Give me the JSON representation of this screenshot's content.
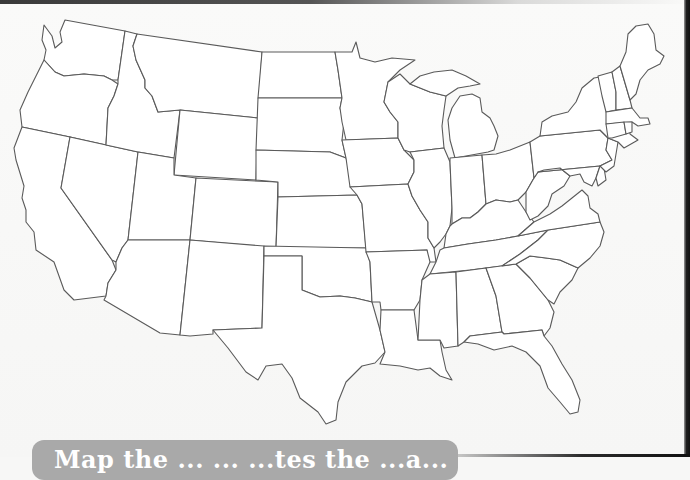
{
  "page": {
    "type": "printed worksheet photo",
    "background_color": "#f7f7f6",
    "outline_color": "#5a5a5a",
    "fill_color": "#ffffff"
  },
  "map": {
    "subject": "Blank outline map of the contiguous United States",
    "labels_visible": false,
    "regions": [
      "washington",
      "oregon",
      "california",
      "idaho",
      "nevada",
      "montana",
      "wyoming",
      "utah",
      "arizona",
      "colorado",
      "new-mexico",
      "north-dakota",
      "south-dakota",
      "nebraska",
      "kansas",
      "oklahoma",
      "texas",
      "minnesota",
      "iowa",
      "missouri",
      "arkansas",
      "louisiana",
      "wisconsin",
      "illinois",
      "michigan",
      "indiana",
      "ohio",
      "kentucky",
      "tennessee",
      "mississippi",
      "alabama",
      "georgia",
      "florida",
      "south-carolina",
      "north-carolina",
      "virginia",
      "west-virginia",
      "pennsylvania",
      "new-york",
      "maryland",
      "delaware",
      "new-jersey",
      "vermont",
      "new-hampshire",
      "maine",
      "massachusetts",
      "connecticut",
      "rhode-island"
    ]
  },
  "caption": {
    "text": "Map the ... ... ...tes the ...a...",
    "background_color": "#a9a9a9",
    "text_color": "#ffffff",
    "note": "text clipped at bottom edge; only tops of letters visible"
  }
}
